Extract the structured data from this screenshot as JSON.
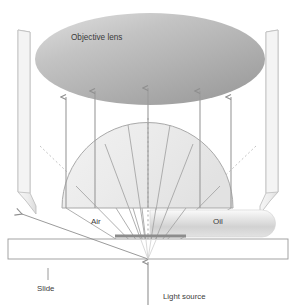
{
  "diagram": {
    "type": "optics-schematic",
    "background_color": "#ffffff",
    "labels": {
      "objective_lens": "Objective lens",
      "air": "Air",
      "oil": "Oil",
      "slide": "Slide",
      "light_source": "Light source"
    },
    "parts": {
      "objective_lens": {
        "name": "objective-lens-ellipse",
        "shape": "ellipse",
        "center_x": 150,
        "center_y": 59,
        "radius_x": 115,
        "radius_y": 46,
        "fill_light": "#e9e9e9",
        "fill_dark": "#9f9f9f"
      },
      "housing_left": {
        "name": "objective-housing-left",
        "fill": "#f0f0f0",
        "stroke": "#b8b8b8"
      },
      "housing_right": {
        "name": "objective-housing-right",
        "fill": "#f0f0f0",
        "stroke": "#b8b8b8"
      },
      "condenser_dome": {
        "name": "condenser-dome",
        "shape": "semicircle",
        "left_x": 62,
        "right_x": 233,
        "base_y": 208,
        "apex_y": 123,
        "fill": "#ececec",
        "stroke": "#a8a8a8"
      },
      "oil_drop": {
        "name": "oil-drop",
        "left_x": 150,
        "right_x": 277,
        "top_y": 210,
        "bottom_y": 237,
        "fill_light": "#f4f4f4",
        "fill_dark": "#cfcfcf"
      },
      "specimen": {
        "name": "specimen-bar",
        "left_x": 115,
        "right_x": 186,
        "y": 236,
        "fill": "#8c8c8c"
      },
      "slide": {
        "name": "microscope-slide",
        "left_x": 8,
        "right_x": 288,
        "top_y": 239,
        "bottom_y": 259,
        "fill": "#ffffff",
        "stroke": "#9a9a9a"
      },
      "light_source_point": {
        "name": "light-source-origin",
        "x": 148,
        "y": 259
      }
    },
    "colors": {
      "ray": "#9b9b9b",
      "arrow": "#8e8e8e",
      "dotted": "#bdbdbd",
      "text": "#3b3b3b",
      "outline": "#a0a0a0"
    },
    "rays": {
      "collected_arrows_x": [
        66,
        95,
        148,
        200,
        232
      ],
      "arrow_top_y": 95,
      "arrow_bottom_y": 208,
      "escaping_ray_label": "refracted-escaping-ray",
      "escaping_ray_end": {
        "x": 20,
        "y": 214
      },
      "fan_ray_count": 7
    }
  }
}
